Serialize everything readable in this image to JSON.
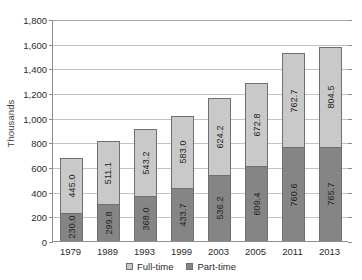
{
  "chart_data": {
    "type": "bar",
    "subtype": "stacked-vertical",
    "title": "",
    "xlabel": "",
    "ylabel": "Thousands",
    "categories": [
      "1979",
      "1989",
      "1993",
      "1999",
      "2003",
      "2005",
      "2011",
      "2013"
    ],
    "series": [
      {
        "name": "Full-time",
        "color": "#c9c9c9",
        "values": [
          445.0,
          511.1,
          543.2,
          583.0,
          624.2,
          672.8,
          762.7,
          804.5
        ],
        "labels": [
          "445.0",
          "511.1",
          "543.2",
          "583.0",
          "624.2",
          "672.8",
          "762.7",
          "804.5"
        ]
      },
      {
        "name": "Part-time",
        "color": "#858585",
        "values": [
          230.0,
          299.8,
          368.0,
          433.7,
          536.2,
          609.4,
          760.6,
          765.7
        ],
        "labels": [
          "230.0",
          "299.8",
          "368.0",
          "433.7",
          "536.2",
          "609.4",
          "760.6",
          "765.7"
        ]
      }
    ],
    "totals": [
      675.0,
      810.9,
      911.2,
      1016.7,
      1160.4,
      1282.2,
      1523.3,
      1570.2
    ],
    "ylim": [
      0,
      1800
    ],
    "ytick_values": [
      0,
      200,
      400,
      600,
      800,
      1000,
      1200,
      1400,
      1600,
      1800
    ],
    "ytick_labels": [
      "0",
      "200",
      "400",
      "600",
      "800",
      "1,000",
      "1,200",
      "1,400",
      "1,600",
      "1,800"
    ],
    "grid": true,
    "legend_position": "bottom-center",
    "legend": [
      {
        "label": "Full-time",
        "color": "#c9c9c9"
      },
      {
        "label": "Part-time",
        "color": "#858585"
      }
    ]
  }
}
